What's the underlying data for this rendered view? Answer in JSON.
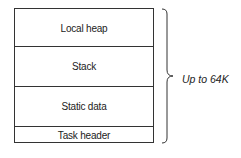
{
  "diagram": {
    "segments": [
      {
        "label": "Local heap"
      },
      {
        "label": "Stack"
      },
      {
        "label": "Static data"
      },
      {
        "label": "Task header"
      }
    ],
    "brace_label": "Up to 64K"
  }
}
